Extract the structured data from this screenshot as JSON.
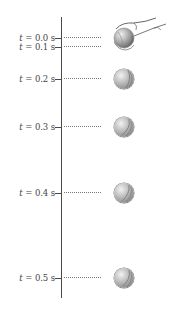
{
  "figure": {
    "type": "free-fall position diagram",
    "axis": {
      "orientation": "vertical"
    },
    "rows": [
      {
        "label_var": "t",
        "label_value": "= 0.0 s",
        "y": 33,
        "ball": false
      },
      {
        "label_var": "t",
        "label_value": "= 0.1 s",
        "y": 42,
        "ball": false
      },
      {
        "label_var": "t",
        "label_value": "= 0.2 s",
        "y": 74,
        "ball": true
      },
      {
        "label_var": "t",
        "label_value": "= 0.3 s",
        "y": 122,
        "ball": true
      },
      {
        "label_var": "t",
        "label_value": "= 0.4 s",
        "y": 188,
        "ball": true
      },
      {
        "label_var": "t",
        "label_value": "= 0.5 s",
        "y": 273,
        "ball": true
      }
    ],
    "hand_illustration": "hand-releasing-ball",
    "colors": {
      "line": "#4a4a4a",
      "text": "#444444",
      "ball_light": "#f2f2f2",
      "ball_dark": "#6a6a6a"
    }
  }
}
